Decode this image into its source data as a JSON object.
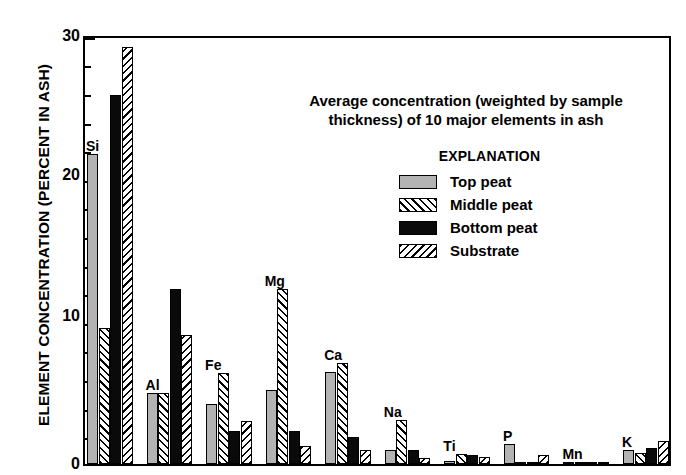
{
  "chart_data": {
    "type": "bar",
    "title": "Average concentration (weighted by sample thickness) of 10 major elements in ash",
    "title_line1": "Average concentration (weighted by sample",
    "title_line2": "thickness) of 10 major elements in ash",
    "xlabel": "",
    "ylabel": "ELEMENT CONCENTRATION (PERCENT IN ASH)",
    "ylim": [
      0,
      30
    ],
    "yticks": [
      0,
      10,
      20,
      30
    ],
    "ytick_labels": [
      "0",
      "10",
      "20",
      "30"
    ],
    "y_minor_tick_interval": 2,
    "grid": false,
    "legend_title": "EXPLANATION",
    "legend_position": "inside-upper-right",
    "categories": [
      "Si",
      "Al",
      "Fe",
      "Mg",
      "Ca",
      "Na",
      "Ti",
      "P",
      "Mn",
      "K"
    ],
    "series": [
      {
        "name": "Top peat",
        "fill": "solid-gray",
        "color": "#b3b3b3",
        "values": [
          21.8,
          5.0,
          4.2,
          5.2,
          6.5,
          1.0,
          0.2,
          1.4,
          0.15,
          1.0
        ]
      },
      {
        "name": "Middle peat",
        "fill": "forward-hatch",
        "color": "#ffffff",
        "values": [
          9.6,
          5.0,
          6.4,
          12.3,
          7.1,
          3.1,
          0.7,
          0.1,
          0.15,
          0.8
        ]
      },
      {
        "name": "Bottom peat",
        "fill": "solid-black",
        "color": "#0a0a0a",
        "values": [
          26.0,
          12.3,
          2.3,
          2.3,
          1.9,
          1.0,
          0.6,
          0.1,
          0.1,
          1.1
        ]
      },
      {
        "name": "Substrate",
        "fill": "backward-hatch",
        "color": "#ffffff",
        "values": [
          29.4,
          9.1,
          3.0,
          1.3,
          1.0,
          0.4,
          0.5,
          0.6,
          0.1,
          1.6
        ]
      }
    ]
  },
  "colors": {
    "axis": "#000000",
    "background": "#ffffff",
    "top_peat": "#b3b3b3",
    "bottom_peat": "#0a0a0a"
  }
}
